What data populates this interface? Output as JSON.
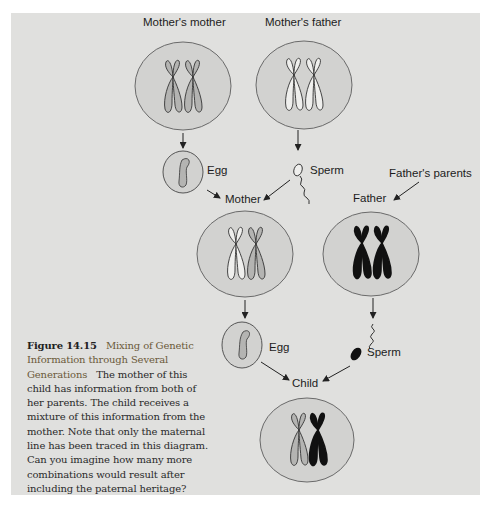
{
  "figure": {
    "number": "Figure 14.15",
    "title": "Mixing of Genetic Information through Several Generations",
    "body": "The mother of this child has information from both of her parents. The child receives a mixture of this information from the mother. Note that only the maternal line has been traced in this diagram. Can you imagine how many more combinations would result after including the paternal heritage?"
  },
  "labels": {
    "mothers_mother": "Mother's mother",
    "mothers_father": "Mother's father",
    "egg_1": "Egg",
    "sperm_1": "Sperm",
    "fathers_parents": "Father's parents",
    "mother": "Mother",
    "father": "Father",
    "egg_2": "Egg",
    "sperm_2": "Sperm",
    "child": "Child"
  },
  "colors": {
    "panel_bg": "#e0e0de",
    "cell_fill": "#d2d2d0",
    "cell_stroke": "#6a6a6a",
    "chromosome_gray": "#b4b4b2",
    "chromosome_white": "#efefed",
    "chromosome_black": "#111111",
    "caption_title": "#6b5a3a"
  }
}
